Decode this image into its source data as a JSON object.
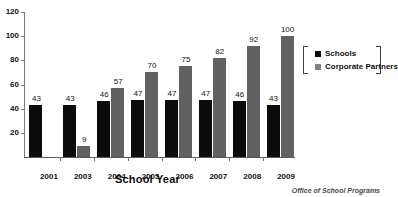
{
  "chart_data": {
    "type": "bar",
    "title": "",
    "xlabel": "School Year",
    "ylabel": "",
    "categories": [
      "2001",
      "2003",
      "2004",
      "2005",
      "2006",
      "2007",
      "2008",
      "2009"
    ],
    "series": [
      {
        "name": "Schools",
        "color": "#0b0b0b",
        "values": [
          43,
          43,
          46,
          47,
          47,
          47,
          46,
          43
        ]
      },
      {
        "name": "Corporate Partners",
        "color": "#616161",
        "values": [
          null,
          9,
          57,
          70,
          75,
          82,
          92,
          100
        ]
      }
    ],
    "ylim": [
      0,
      120
    ],
    "yticks": [
      0,
      20,
      40,
      60,
      80,
      100,
      120
    ],
    "ytick_labels": [
      "",
      "20",
      "40",
      "60",
      "80",
      "100",
      "120"
    ],
    "grid": false,
    "legend_position": "right",
    "data_labels": true
  },
  "legend": {
    "entries": [
      {
        "label": "Schools",
        "swatch": "schools-swatch"
      },
      {
        "label": "Corporate Partners",
        "swatch": "corporate-partners-swatch"
      }
    ]
  },
  "axis": {
    "x_title": "School Year"
  },
  "footer": {
    "source": "Office of School Programs"
  }
}
